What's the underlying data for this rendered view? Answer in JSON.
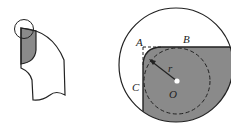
{
  "figure_left": {
    "description": "tool bit with small circle marking the rounded tip",
    "shaded_color": "#8a8a8a"
  },
  "figure_right": {
    "labels": {
      "A": "A",
      "B": "B",
      "C": "C",
      "O": "O",
      "r": "r"
    },
    "shaded_color": "#8a8a8a"
  }
}
